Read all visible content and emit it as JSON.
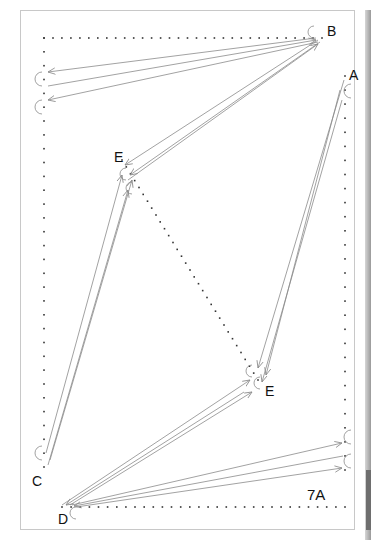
{
  "figure": {
    "caption_label": "7A",
    "nodes": [
      {
        "id": "A",
        "label": "A",
        "x": 345,
        "y": 76,
        "label_x": 349,
        "label_y": 68
      },
      {
        "id": "B",
        "label": "B",
        "x": 318,
        "y": 38,
        "label_x": 327,
        "label_y": 24
      },
      {
        "id": "C",
        "label": "C",
        "x": 44,
        "y": 467,
        "label_x": 32,
        "label_y": 474
      },
      {
        "id": "D",
        "label": "D",
        "x": 62,
        "y": 507,
        "label_x": 58,
        "label_y": 512
      },
      {
        "id": "E1",
        "label": "E",
        "x": 122,
        "y": 160,
        "label_x": 114,
        "label_y": 150
      },
      {
        "id": "E2",
        "label": "E",
        "x": 258,
        "y": 380,
        "label_x": 265,
        "label_y": 384
      }
    ],
    "dotted_paths": [
      {
        "name": "top-row",
        "from": [
          44,
          38
        ],
        "to": [
          322,
          38
        ],
        "spacing": 9
      },
      {
        "name": "left-column",
        "from": [
          44,
          38
        ],
        "to": [
          44,
          467
        ],
        "spacing": 14
      },
      {
        "name": "bottom-row",
        "from": [
          62,
          507
        ],
        "to": [
          345,
          507
        ],
        "spacing": 9
      },
      {
        "name": "right-column",
        "from": [
          345,
          76
        ],
        "to": [
          345,
          470
        ],
        "spacing": 14
      },
      {
        "name": "center-diagonal",
        "from": [
          122,
          160
        ],
        "to": [
          258,
          380
        ],
        "spacing": 8
      }
    ],
    "arrows": [
      {
        "from": [
          316,
          38
        ],
        "to": [
          48,
          72
        ]
      },
      {
        "from": [
          48,
          86
        ],
        "to": [
          316,
          40
        ]
      },
      {
        "from": [
          318,
          42
        ],
        "to": [
          48,
          100
        ]
      },
      {
        "from": [
          318,
          40
        ],
        "to": [
          125,
          165
        ]
      },
      {
        "from": [
          128,
          180
        ],
        "to": [
          318,
          44
        ]
      },
      {
        "from": [
          320,
          42
        ],
        "to": [
          130,
          175
        ]
      },
      {
        "from": [
          344,
          80
        ],
        "to": [
          258,
          368
        ]
      },
      {
        "from": [
          342,
          100
        ],
        "to": [
          262,
          382
        ]
      },
      {
        "from": [
          340,
          90
        ],
        "to": [
          266,
          375
        ]
      },
      {
        "from": [
          46,
          453
        ],
        "to": [
          122,
          175
        ]
      },
      {
        "from": [
          48,
          465
        ],
        "to": [
          128,
          190
        ]
      },
      {
        "from": [
          50,
          460
        ],
        "to": [
          132,
          180
        ]
      },
      {
        "from": [
          62,
          505
        ],
        "to": [
          250,
          380
        ]
      },
      {
        "from": [
          244,
          392
        ],
        "to": [
          66,
          505
        ]
      },
      {
        "from": [
          70,
          505
        ],
        "to": [
          252,
          392
        ]
      },
      {
        "from": [
          72,
          505
        ],
        "to": [
          342,
          443
        ]
      },
      {
        "from": [
          343,
          456
        ],
        "to": [
          74,
          506
        ]
      },
      {
        "from": [
          76,
          507
        ],
        "to": [
          342,
          468
        ]
      }
    ],
    "loops": [
      {
        "cx": 40,
        "cy": 79,
        "r": 7
      },
      {
        "cx": 40,
        "cy": 107,
        "r": 7
      },
      {
        "cx": 312,
        "cy": 32,
        "r": 6
      },
      {
        "cx": 349,
        "cy": 91,
        "r": 7
      },
      {
        "cx": 124,
        "cy": 174,
        "r": 6
      },
      {
        "cx": 130,
        "cy": 188,
        "r": 6
      },
      {
        "cx": 250,
        "cy": 371,
        "r": 6
      },
      {
        "cx": 258,
        "cy": 383,
        "r": 6
      },
      {
        "cx": 40,
        "cy": 453,
        "r": 7
      },
      {
        "cx": 74,
        "cy": 513,
        "r": 6
      },
      {
        "cx": 349,
        "cy": 437,
        "r": 7
      },
      {
        "cx": 349,
        "cy": 461,
        "r": 7
      }
    ],
    "colors": {
      "dot": "#333333",
      "arrow": "#8a8a8a",
      "frame": "#c8c8c8",
      "text": "#111111"
    }
  }
}
